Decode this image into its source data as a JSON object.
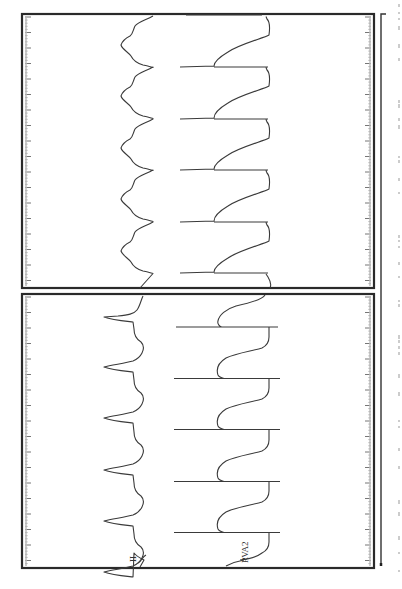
{
  "figure": {
    "orientation": "rotated-90",
    "frame_color": "#2a2a2a",
    "trace_color": "#3a3a3a"
  },
  "panels": [
    {
      "id": "top",
      "bounds": {
        "x": 22,
        "y": 14,
        "w": 352,
        "h": 274
      },
      "leads": [
        {
          "label": "II",
          "type": "surface-ecg"
        },
        {
          "label": "RVA2",
          "type": "intracardiac"
        }
      ],
      "beat_positions_y": [
        16,
        67,
        119,
        170,
        222,
        273
      ],
      "cycle_px": 51.5
    },
    {
      "id": "bottom",
      "bounds": {
        "x": 22,
        "y": 294,
        "w": 352,
        "h": 274
      },
      "leads": [
        {
          "label": "II",
          "type": "surface-ecg"
        },
        {
          "label": "RVA2",
          "type": "intracardiac"
        }
      ],
      "beat_positions_y": [
        327,
        378,
        430,
        481,
        532
      ],
      "cycle_px": 51.3
    }
  ],
  "labels": {
    "lead_ii": "II",
    "lead_rva2": "RVA2"
  }
}
